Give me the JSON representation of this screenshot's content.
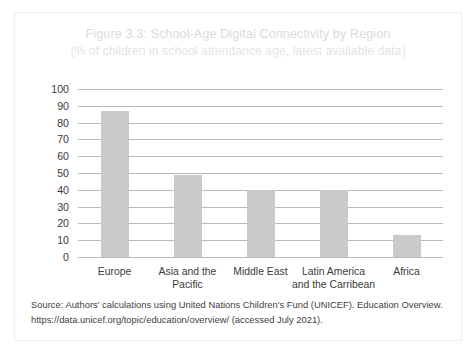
{
  "figure": {
    "title": "Figure 3.3: School-Age Digital Connectivity by Region",
    "subtitle": "(% of children in school attendance age, latest available data)",
    "source_line_1": "Source: Authors' calculations using United Nations Children's Fund (UNICEF). Education Overview.",
    "source_line_2": "https://data.unicef.org/topic/education/overview/ (accessed July 2021)."
  },
  "colors": {
    "bar": "#c9cacb",
    "gridline": "#b9babc",
    "title_text": "#d9dce0",
    "axis_text": "#3b3b3d",
    "source_text": "#3f4042",
    "card_border": "#eceef0"
  },
  "chart_data": {
    "type": "bar",
    "title": "Figure 3.3: School-Age Digital Connectivity by Region",
    "subtitle": "(% of children in school attendance age, latest available data)",
    "xlabel": "",
    "ylabel": "",
    "ylim": [
      0,
      100
    ],
    "ytick_step": 10,
    "yticks": [
      100,
      90,
      80,
      70,
      60,
      50,
      40,
      30,
      20,
      10,
      0
    ],
    "grid": true,
    "legend": false,
    "categories": [
      "Europe",
      "Asia and the\nPacific",
      "Middle East",
      "Latin America\nand the Carribean",
      "Africa"
    ],
    "values": [
      87,
      49,
      40,
      40,
      13
    ]
  }
}
